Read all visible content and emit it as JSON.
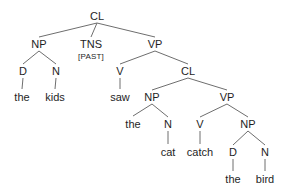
{
  "tree": {
    "line_color": "#6e6e6e",
    "text_color": "#1e1e1e",
    "nodes": [
      {
        "id": "cl1",
        "label": "CL",
        "x": 97,
        "y": 16
      },
      {
        "id": "np1",
        "label": "NP",
        "x": 39,
        "y": 44
      },
      {
        "id": "tns",
        "label": "TNS",
        "x": 91,
        "y": 44,
        "feature": "[PAST]"
      },
      {
        "id": "vp1",
        "label": "VP",
        "x": 155,
        "y": 44
      },
      {
        "id": "d1",
        "label": "D",
        "x": 23,
        "y": 71
      },
      {
        "id": "n1",
        "label": "N",
        "x": 56,
        "y": 71
      },
      {
        "id": "the1",
        "label": "the",
        "x": 22,
        "y": 97
      },
      {
        "id": "kids",
        "label": "kids",
        "x": 55,
        "y": 97
      },
      {
        "id": "v1",
        "label": "V",
        "x": 120,
        "y": 71
      },
      {
        "id": "cl2",
        "label": "CL",
        "x": 188,
        "y": 71
      },
      {
        "id": "saw",
        "label": "saw",
        "x": 120,
        "y": 97
      },
      {
        "id": "np2",
        "label": "NP",
        "x": 152,
        "y": 97
      },
      {
        "id": "vp2",
        "label": "VP",
        "x": 227,
        "y": 97
      },
      {
        "id": "the2",
        "label": "the",
        "x": 133,
        "y": 124
      },
      {
        "id": "n2",
        "label": "N",
        "x": 168,
        "y": 124
      },
      {
        "id": "cat",
        "label": "cat",
        "x": 168,
        "y": 152
      },
      {
        "id": "v2",
        "label": "V",
        "x": 200,
        "y": 124
      },
      {
        "id": "catch",
        "label": "catch",
        "x": 200,
        "y": 152
      },
      {
        "id": "np3",
        "label": "NP",
        "x": 248,
        "y": 124
      },
      {
        "id": "d2",
        "label": "D",
        "x": 233,
        "y": 152
      },
      {
        "id": "n3",
        "label": "N",
        "x": 265,
        "y": 152
      },
      {
        "id": "the3",
        "label": "the",
        "x": 233,
        "y": 179
      },
      {
        "id": "bird",
        "label": "bird",
        "x": 265,
        "y": 179
      }
    ],
    "edges": [
      [
        "cl1",
        "np1"
      ],
      [
        "cl1",
        "tns"
      ],
      [
        "cl1",
        "vp1"
      ],
      [
        "np1",
        "d1"
      ],
      [
        "np1",
        "n1"
      ],
      [
        "d1",
        "the1"
      ],
      [
        "n1",
        "kids"
      ],
      [
        "vp1",
        "v1"
      ],
      [
        "vp1",
        "cl2"
      ],
      [
        "v1",
        "saw"
      ],
      [
        "cl2",
        "np2"
      ],
      [
        "cl2",
        "vp2"
      ],
      [
        "np2",
        "the2"
      ],
      [
        "np2",
        "n2"
      ],
      [
        "n2",
        "cat"
      ],
      [
        "vp2",
        "v2"
      ],
      [
        "vp2",
        "np3"
      ],
      [
        "v2",
        "catch"
      ],
      [
        "np3",
        "d2"
      ],
      [
        "np3",
        "n3"
      ],
      [
        "d2",
        "the3"
      ],
      [
        "n3",
        "bird"
      ]
    ]
  }
}
